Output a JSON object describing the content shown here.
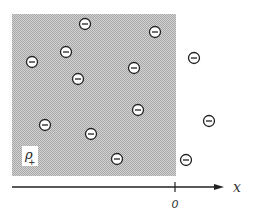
{
  "diagram": {
    "region": {
      "x": 12,
      "y": 14,
      "width": 164,
      "height": 162,
      "fill": "#c4c4c4",
      "label": "ρ",
      "label_sub": "+"
    },
    "axis": {
      "x_start": 12,
      "x_end": 224,
      "y": 187,
      "label": "x",
      "tick_x": 175,
      "tick_label": "0"
    },
    "charges": [
      {
        "x": 85,
        "y": 24,
        "sign": "−"
      },
      {
        "x": 155,
        "y": 32,
        "sign": "−"
      },
      {
        "x": 66,
        "y": 52,
        "sign": "−"
      },
      {
        "x": 32,
        "y": 62,
        "sign": "−"
      },
      {
        "x": 194,
        "y": 58,
        "sign": "−"
      },
      {
        "x": 134,
        "y": 68,
        "sign": "−"
      },
      {
        "x": 78,
        "y": 79,
        "sign": "−"
      },
      {
        "x": 138,
        "y": 110,
        "sign": "−"
      },
      {
        "x": 209,
        "y": 121,
        "sign": "−"
      },
      {
        "x": 45,
        "y": 125,
        "sign": "−"
      },
      {
        "x": 91,
        "y": 134,
        "sign": "−"
      },
      {
        "x": 117,
        "y": 159,
        "sign": "−"
      },
      {
        "x": 186,
        "y": 160,
        "sign": "−"
      }
    ]
  }
}
